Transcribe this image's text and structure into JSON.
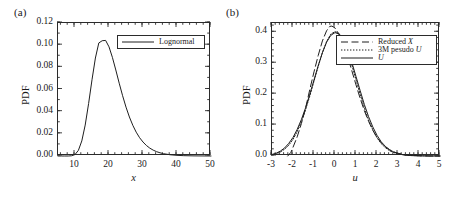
{
  "figure": {
    "panels": [
      {
        "tag": "(a)",
        "legend": [
          {
            "label": "Lognormal",
            "style": "solid"
          }
        ]
      },
      {
        "tag": "(b)",
        "legend": [
          {
            "label": "Reduced X",
            "style": "long-dash"
          },
          {
            "label": "3M pesudo U",
            "style": "dotted"
          },
          {
            "label": "U",
            "style": "solid"
          }
        ]
      }
    ]
  },
  "chart_data": [
    {
      "type": "line",
      "panel": "(a)",
      "title": "",
      "xlabel": "x",
      "ylabel": "PDF",
      "xlim": [
        5,
        50
      ],
      "ylim": [
        0.0,
        0.12
      ],
      "xticks": [
        10,
        20,
        30,
        40,
        50
      ],
      "xtick_labels": [
        "10",
        "20",
        "30",
        "40",
        "50"
      ],
      "yticks": [
        0.0,
        0.02,
        0.04,
        0.06,
        0.08,
        0.1,
        0.12
      ],
      "ytick_labels": [
        "0.00",
        "0.02",
        "0.04",
        "0.06",
        "0.08",
        "0.10",
        "0.12"
      ],
      "minor_ticks": true,
      "grid": false,
      "legend_position": "upper right",
      "series": [
        {
          "name": "Lognormal",
          "style": "solid",
          "x": [
            5,
            6,
            7,
            8,
            9,
            10,
            11,
            12,
            13,
            14,
            15,
            16,
            17,
            18,
            19,
            20,
            21,
            22,
            23,
            24,
            25,
            26,
            27,
            28,
            29,
            30,
            31,
            32,
            33,
            34,
            35,
            36,
            38,
            40,
            42,
            45,
            50
          ],
          "y": [
            0.0,
            0.0,
            0.0,
            0.0,
            0.0002,
            0.0013,
            0.0051,
            0.0136,
            0.0279,
            0.0473,
            0.0688,
            0.0884,
            0.102,
            0.104,
            0.1043,
            0.0985,
            0.089,
            0.0776,
            0.0657,
            0.0544,
            0.0441,
            0.0352,
            0.0277,
            0.0215,
            0.0165,
            0.0126,
            0.0095,
            0.0071,
            0.0053,
            0.0039,
            0.0029,
            0.0021,
            0.0011,
            0.0006,
            0.0003,
            0.0001,
            0.0
          ]
        }
      ]
    },
    {
      "type": "line",
      "panel": "(b)",
      "title": "",
      "xlabel": "u",
      "ylabel": "PDF",
      "xlim": [
        -3,
        5
      ],
      "ylim": [
        0.0,
        0.43
      ],
      "xticks": [
        -3,
        -2,
        -1,
        0,
        1,
        2,
        3,
        4,
        5
      ],
      "xtick_labels": [
        "-3",
        "-2",
        "-1",
        "0",
        "1",
        "2",
        "3",
        "4",
        "5"
      ],
      "yticks": [
        0.0,
        0.1,
        0.2,
        0.3,
        0.4
      ],
      "ytick_labels": [
        "0.0",
        "0.1",
        "0.2",
        "0.3",
        "0.4"
      ],
      "minor_ticks": true,
      "grid": false,
      "legend_position": "upper right",
      "series": [
        {
          "name": "Reduced X",
          "style": "long-dash",
          "x": [
            -2.25,
            -2.1,
            -2.0,
            -1.8,
            -1.6,
            -1.4,
            -1.2,
            -1.0,
            -0.8,
            -0.6,
            -0.4,
            -0.25,
            -0.15,
            0.0,
            0.2,
            0.4,
            0.6,
            0.8,
            1.0,
            1.2,
            1.4,
            1.6,
            1.8,
            2.0,
            2.2,
            2.4,
            2.6,
            2.8,
            3.0,
            3.3,
            3.6,
            4.0,
            4.5,
            5.0
          ],
          "y": [
            0.0,
            0.012,
            0.028,
            0.062,
            0.105,
            0.155,
            0.215,
            0.272,
            0.325,
            0.372,
            0.405,
            0.419,
            0.42,
            0.414,
            0.392,
            0.362,
            0.322,
            0.276,
            0.23,
            0.186,
            0.146,
            0.112,
            0.083,
            0.06,
            0.043,
            0.03,
            0.02,
            0.013,
            0.009,
            0.004,
            0.002,
            0.001,
            0.0,
            0.0
          ]
        },
        {
          "name": "3M pesudo U",
          "style": "dotted",
          "x": [
            -3.0,
            -2.8,
            -2.6,
            -2.4,
            -2.2,
            -2.0,
            -1.8,
            -1.6,
            -1.4,
            -1.2,
            -1.0,
            -0.8,
            -0.6,
            -0.4,
            -0.2,
            0.0,
            0.2,
            0.4,
            0.6,
            0.8,
            1.0,
            1.2,
            1.4,
            1.6,
            1.8,
            2.0,
            2.2,
            2.4,
            2.6,
            2.8,
            3.0,
            3.3,
            3.6,
            4.0,
            4.5,
            5.0
          ],
          "y": [
            0.004,
            0.007,
            0.013,
            0.022,
            0.035,
            0.054,
            0.079,
            0.111,
            0.15,
            0.194,
            0.242,
            0.29,
            0.334,
            0.37,
            0.394,
            0.402,
            0.396,
            0.374,
            0.339,
            0.295,
            0.247,
            0.199,
            0.155,
            0.116,
            0.085,
            0.059,
            0.04,
            0.027,
            0.017,
            0.011,
            0.007,
            0.003,
            0.0015,
            0.0006,
            0.0002,
            0.0
          ]
        },
        {
          "name": "U",
          "style": "solid",
          "x": [
            -3.0,
            -2.8,
            -2.6,
            -2.4,
            -2.2,
            -2.0,
            -1.8,
            -1.6,
            -1.4,
            -1.2,
            -1.0,
            -0.8,
            -0.6,
            -0.4,
            -0.2,
            0.0,
            0.2,
            0.4,
            0.6,
            0.8,
            1.0,
            1.2,
            1.4,
            1.6,
            1.8,
            2.0,
            2.2,
            2.4,
            2.6,
            2.8,
            3.0,
            3.3,
            3.6,
            4.0,
            4.5,
            5.0
          ],
          "y": [
            0.005,
            0.009,
            0.016,
            0.026,
            0.041,
            0.06,
            0.086,
            0.118,
            0.156,
            0.2,
            0.246,
            0.292,
            0.334,
            0.368,
            0.39,
            0.399,
            0.394,
            0.375,
            0.344,
            0.303,
            0.257,
            0.211,
            0.166,
            0.127,
            0.094,
            0.067,
            0.046,
            0.031,
            0.02,
            0.013,
            0.008,
            0.0035,
            0.0016,
            0.0006,
            0.0002,
            0.0
          ]
        }
      ]
    }
  ]
}
